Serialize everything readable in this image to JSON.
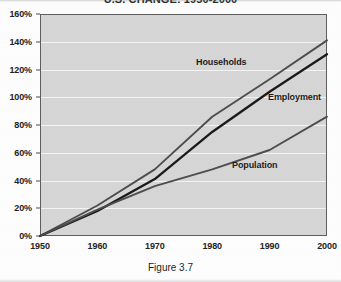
{
  "chart_data": {
    "type": "line",
    "title": "U.S. CHANGE: 1950-2000",
    "caption": "Figure 3.7",
    "xlabel": "",
    "ylabel": "",
    "grid": true,
    "legend_position": "inline-labels",
    "x": [
      1950,
      1960,
      1970,
      1980,
      1990,
      2000
    ],
    "xtick_labels": [
      "1950",
      "1960",
      "1970",
      "1980",
      "1990",
      "2000"
    ],
    "ytick_labels": [
      "0%",
      "20%",
      "40%",
      "60%",
      "80%",
      "100%",
      "120%",
      "140%",
      "160%"
    ],
    "ytick_values": [
      0,
      20,
      40,
      60,
      80,
      100,
      120,
      140,
      160
    ],
    "ylim": [
      0,
      160
    ],
    "xlim": [
      1950,
      2000
    ],
    "series": [
      {
        "name": "Households",
        "label": "Households",
        "color": "#4d4d4d",
        "values": [
          0,
          22,
          48,
          86,
          113,
          141
        ]
      },
      {
        "name": "Employment",
        "label": "Employment",
        "color": "#1a1a1a",
        "values": [
          0,
          18,
          41,
          75,
          104,
          131
        ]
      },
      {
        "name": "Population",
        "label": "Population",
        "color": "#4d4d4d",
        "values": [
          0,
          19,
          36,
          48,
          62,
          86
        ]
      }
    ],
    "plot_background": "#d6d6d6",
    "gridline_color": "#f4f4f4",
    "frame_color": "#5d5d5d"
  }
}
